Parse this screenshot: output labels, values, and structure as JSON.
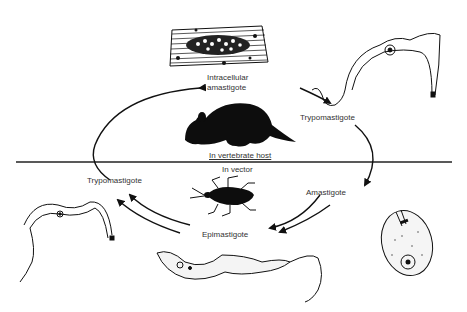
{
  "diagram": {
    "divider": {
      "upper_label": "In vertebrate host",
      "lower_label": "In vector"
    },
    "stages": [
      {
        "id": "intracellular-amastigote",
        "label_line1": "Intracellular",
        "label_line2": "amastigote"
      },
      {
        "id": "trypomastigote-host",
        "label": "Trypomastigote"
      },
      {
        "id": "amastigote-vector",
        "label": "Amastigote"
      },
      {
        "id": "epimastigote",
        "label": "Epimastigote"
      },
      {
        "id": "trypomastigote-vector",
        "label": "Trypomastigote"
      }
    ],
    "hosts": [
      {
        "id": "rodent",
        "icon": "rodent-icon"
      },
      {
        "id": "bug",
        "icon": "triatomine-bug-icon"
      }
    ],
    "colors": {
      "ink": "#111111",
      "text": "#333333",
      "background": "#ffffff"
    }
  }
}
